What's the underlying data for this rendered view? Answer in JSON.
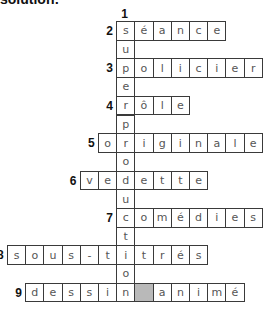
{
  "heading": "solution:",
  "grid": {
    "origin_x": 7,
    "origin_y": 21,
    "cell_w": 18.2,
    "cell_h": 18.7,
    "blank_color": "#b9b9b9"
  },
  "down": {
    "number": "1",
    "col": 6,
    "start_row": 0,
    "word": "superproduction"
  },
  "across": [
    {
      "number": "2",
      "row": 0,
      "col": 6,
      "cells": [
        "s",
        "é",
        "a",
        "n",
        "c",
        "e"
      ]
    },
    {
      "number": "3",
      "row": 2,
      "col": 6,
      "cells": [
        "p",
        "o",
        "l",
        "i",
        "c",
        "i",
        "e",
        "r"
      ]
    },
    {
      "number": "4",
      "row": 4,
      "col": 6,
      "cells": [
        "r",
        "ô",
        "l",
        "e"
      ]
    },
    {
      "number": "5",
      "row": 6,
      "col": 5,
      "cells": [
        "o",
        "r",
        "i",
        "g",
        "i",
        "n",
        "a",
        "l",
        "e"
      ]
    },
    {
      "number": "6",
      "row": 8,
      "col": 4,
      "cells": [
        "v",
        "e",
        "d",
        "e",
        "t",
        "t",
        "e"
      ]
    },
    {
      "number": "7",
      "row": 10,
      "col": 6,
      "cells": [
        "c",
        "o",
        "m",
        "é",
        "d",
        "i",
        "e",
        "s"
      ]
    },
    {
      "number": "8",
      "row": 12,
      "col": 0,
      "cells": [
        "s",
        "o",
        "u",
        "s",
        "-",
        "t",
        "i",
        "t",
        "r",
        "é",
        "s"
      ]
    },
    {
      "number": "9",
      "row": 14,
      "col": 1,
      "cells": [
        "d",
        "e",
        "s",
        "s",
        "i",
        "n",
        "",
        "a",
        "n",
        "i",
        "m",
        "é"
      ]
    }
  ]
}
